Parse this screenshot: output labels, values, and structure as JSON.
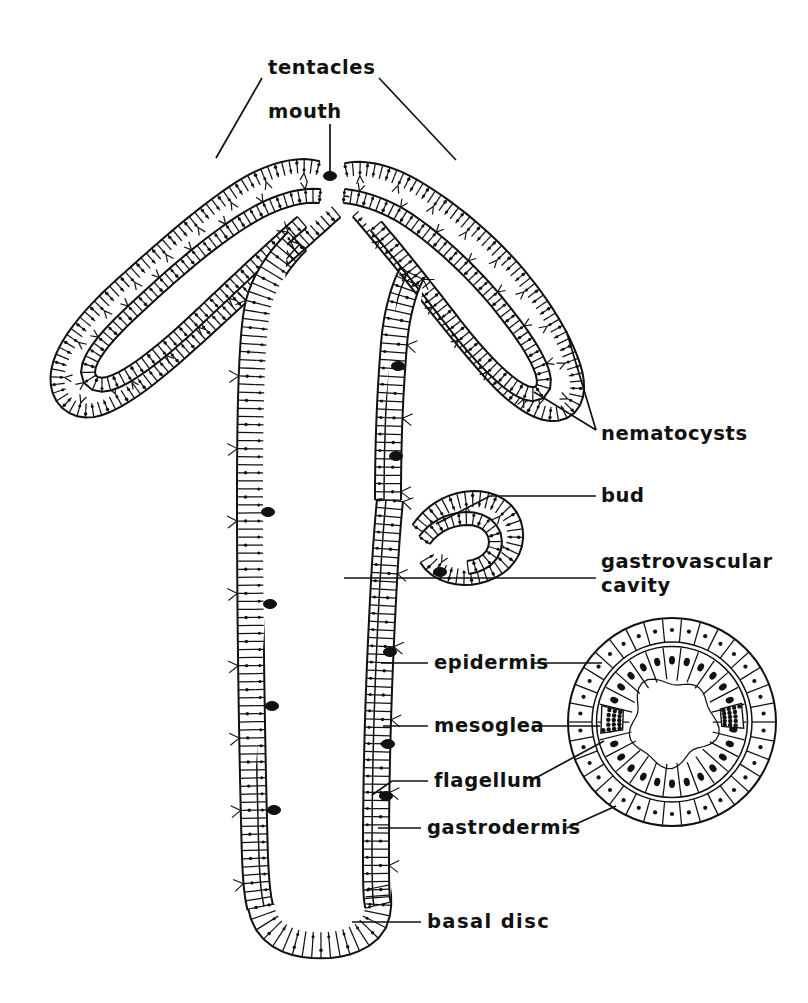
{
  "figure": {
    "background_color": "#ffffff",
    "ink_color": "#111111"
  },
  "labels": [
    {
      "id": "tentacles",
      "text": "tentacles",
      "x": 268,
      "y": 68,
      "anchor": "start",
      "wide": false
    },
    {
      "id": "mouth",
      "text": "mouth",
      "x": 268,
      "y": 112,
      "anchor": "start",
      "wide": false
    },
    {
      "id": "nematocysts",
      "text": "nematocysts",
      "x": 601,
      "y": 434,
      "anchor": "start",
      "wide": false
    },
    {
      "id": "bud",
      "text": "bud",
      "x": 601,
      "y": 496,
      "anchor": "start",
      "wide": false
    },
    {
      "id": "gastrovascular",
      "text": "gastrovascular",
      "x": 601,
      "y": 562,
      "anchor": "start",
      "wide": false
    },
    {
      "id": "cavity",
      "text": "cavity",
      "x": 601,
      "y": 586,
      "anchor": "start",
      "wide": false
    },
    {
      "id": "epidermis",
      "text": "epidermis",
      "x": 434,
      "y": 663,
      "anchor": "start",
      "wide": false
    },
    {
      "id": "mesoglea",
      "text": "mesoglea",
      "x": 434,
      "y": 726,
      "anchor": "start",
      "wide": false
    },
    {
      "id": "flagellum",
      "text": "flagellum",
      "x": 434,
      "y": 781,
      "anchor": "start",
      "wide": false
    },
    {
      "id": "gastrodermis",
      "text": "gastrodermis",
      "x": 427,
      "y": 828,
      "anchor": "start",
      "wide": false
    },
    {
      "id": "basal-disc",
      "text": "basal  disc",
      "x": 427,
      "y": 922,
      "anchor": "start",
      "wide": true
    }
  ],
  "leaders": [
    {
      "id": "tentacles-left",
      "points": "262,78 216,158"
    },
    {
      "id": "tentacles-right",
      "points": "379,78 456,160"
    },
    {
      "id": "mouth-stem",
      "points": "330,124 330,172"
    },
    {
      "id": "nematocysts-a",
      "points": "596,430 566,330"
    },
    {
      "id": "nematocysts-b",
      "points": "596,430 534,392"
    },
    {
      "id": "bud-line",
      "points": "596,496 490,496 436,524"
    },
    {
      "id": "gastrovascular-line",
      "points": "596,578 344,578"
    },
    {
      "id": "epidermis-left",
      "points": "428,663 381,663"
    },
    {
      "id": "epidermis-right",
      "points": "534,663 602,663"
    },
    {
      "id": "mesoglea-left",
      "points": "428,726 383,726"
    },
    {
      "id": "mesoglea-right",
      "points": "532,726 600,726"
    },
    {
      "id": "flagellum-left",
      "points": "428,781 392,781 372,795"
    },
    {
      "id": "flagellum-right",
      "points": "530,781 604,741"
    },
    {
      "id": "gastrodermis-left",
      "points": "421,828 378,828"
    },
    {
      "id": "gastrodermis-right",
      "points": "567,828 616,806"
    },
    {
      "id": "basal-disc-line",
      "points": "421,922 352,922"
    }
  ],
  "structure": {
    "tentacle_left": {
      "outer": "M 318 168 C 300 163 276 168 250 182 C 210 205 160 250 120 286 C 88 315 62 346 58 372 C 54 398 72 414 94 410 C 118 405 150 380 186 348 C 226 312 268 272 300 244 C 318 228 330 217 336 212",
      "inner": "M 320 196 C 300 194 274 202 248 218 C 208 242 164 282 132 312 C 106 336 88 358 88 372 C 88 384 100 388 114 382 C 134 374 164 350 196 320 C 232 286 272 248 302 222"
    },
    "tentacle_right": {
      "outer": "M 346 170 C 364 166 390 172 414 186 C 452 208 492 242 520 276 C 548 310 566 342 574 368 C 582 394 574 412 556 414 C 536 416 510 396 486 368 C 458 336 430 300 408 272 C 390 250 372 228 358 212",
      "inner": "M 344 196 C 366 198 392 208 414 224 C 448 248 484 284 508 316 C 530 344 544 368 544 382 C 544 394 534 398 520 390 C 502 380 478 354 456 326 C 430 292 400 254 376 226"
    },
    "body_left_wall": "M 300 244 C 282 262 268 282 262 306 C 256 334 254 400 254 500 C 254 620 256 740 258 820 C 259 866 260 890 264 906",
    "body_right_wall": "M 408 272 C 398 292 392 318 390 344 C 386 392 384 440 384 500",
    "basal_disc": "M 264 906 C 268 928 284 940 312 942 C 340 944 364 936 372 920 C 376 910 376 898 374 888",
    "bud": {
      "outer": "M 420 530 C 432 512 452 500 474 500 C 496 500 512 512 514 532 C 516 552 502 568 480 574 C 458 580 436 572 428 558",
      "inner": "M 424 540 C 434 526 450 518 468 518 C 484 518 496 528 496 542 C 496 556 484 566 468 568"
    },
    "lower_column": "M 386 500 C 382 540 380 580 378 620 C 374 700 372 780 372 850 C 372 880 372 898 374 906"
  },
  "cross_section": {
    "center_x": 672,
    "center_y": 722,
    "outer_radius": 104,
    "mesoglea_radius": 80,
    "inner_radius": 42,
    "epidermis_cell_count": 34,
    "gastrodermis_cell_count": 26,
    "nematocyst_patches": [
      {
        "angle_deg": 182,
        "span_deg": 22
      },
      {
        "angle_deg": 355,
        "span_deg": 20
      }
    ]
  },
  "wall_texture": {
    "epidermis_cell_width": 9,
    "gastrodermis_cell_length": 17,
    "nucleus_radius": 1.7
  },
  "nematocyst_blobs": [
    {
      "x": 268,
      "y": 512
    },
    {
      "x": 270,
      "y": 604
    },
    {
      "x": 272,
      "y": 706
    },
    {
      "x": 274,
      "y": 810
    },
    {
      "x": 398,
      "y": 366
    },
    {
      "x": 396,
      "y": 456
    },
    {
      "x": 390,
      "y": 652
    },
    {
      "x": 388,
      "y": 744
    },
    {
      "x": 386,
      "y": 796
    },
    {
      "x": 440,
      "y": 572
    },
    {
      "x": 330,
      "y": 176
    }
  ]
}
